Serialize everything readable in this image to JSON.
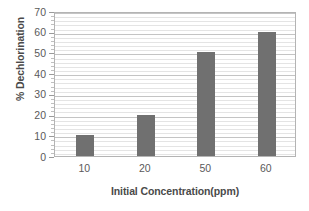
{
  "chart_data": {
    "type": "bar",
    "title": "",
    "subtitle": "",
    "categories": [
      "10",
      "20",
      "50",
      "60"
    ],
    "values": [
      10,
      20,
      50,
      60
    ],
    "series": [
      {
        "name": "% Dechlorination",
        "values": [
          10,
          20,
          50,
          60
        ]
      }
    ],
    "xlabel": "Initial Concentration(ppm)",
    "ylabel": "% Dechlorination",
    "ylim": [
      0,
      70
    ],
    "y_ticks": [
      0,
      10,
      20,
      30,
      40,
      50,
      60,
      70
    ],
    "y_tick_labels": [
      "0",
      "10",
      "20",
      "30",
      "40",
      "50",
      "60",
      "70"
    ],
    "y_major_step": 10,
    "y_minor_step": 2,
    "grid": true,
    "grid_axis": "y",
    "legend": false,
    "legend_position": "none",
    "bar_color": "#707070",
    "plot_background": "#ffffff",
    "frame_color": "#b4b4b4",
    "major_gridline_color": "#c4c4c4",
    "minor_gridline_color": "#e4e4e4",
    "text_color": "#5a5a5a",
    "axis_title_color": "#4a4a4a",
    "annotations": []
  }
}
